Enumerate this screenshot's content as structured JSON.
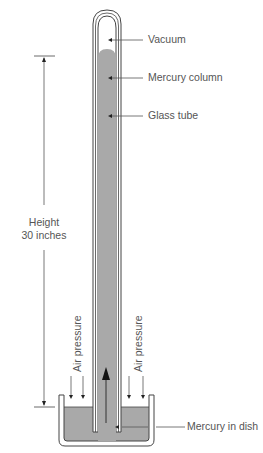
{
  "diagram": {
    "type": "mercury barometer",
    "labels": {
      "vacuum": "Vacuum",
      "mercury_column": "Mercury column",
      "glass_tube": "Glass tube",
      "height_line1": "Height",
      "height_line2": "30 inches",
      "air_pressure_left": "Air pressure",
      "air_pressure_right": "Air pressure",
      "mercury_dish": "Mercury in dish"
    },
    "colors": {
      "mercury": "#a9a9a9",
      "lines": "#555555",
      "text": "#555555"
    }
  }
}
